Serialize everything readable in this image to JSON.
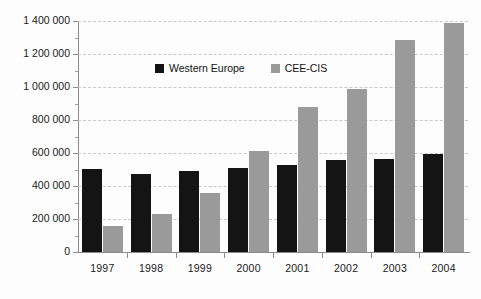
{
  "chart_data": {
    "type": "bar",
    "title": "",
    "subtitle": "",
    "xlabel": "",
    "ylabel": "",
    "categories": [
      "1997",
      "1998",
      "1999",
      "2000",
      "2001",
      "2002",
      "2003",
      "2004"
    ],
    "series": [
      {
        "name": "Western Europe",
        "color": "#141414",
        "values": [
          505000,
          470000,
          490000,
          510000,
          530000,
          560000,
          565000,
          595000
        ]
      },
      {
        "name": "CEE-CIS",
        "color": "#9a9a9a",
        "values": [
          160000,
          230000,
          360000,
          615000,
          880000,
          985000,
          1285000,
          1385000
        ]
      }
    ],
    "ylim": [
      0,
      1400000
    ],
    "y_tick_values": [
      0,
      200000,
      400000,
      600000,
      800000,
      1000000,
      1200000,
      1400000
    ],
    "y_tick_labels": [
      "0",
      "200 000",
      "400 000",
      "600 000",
      "800 000",
      "1 000 000",
      "1 200 000",
      "1 400 000"
    ],
    "y_minor_tick_interval": 100000,
    "grid": "horizontal-dashed",
    "legend_position": "inside-upper-left",
    "background_color": "#fdfdfd",
    "axis_color": "#8a8a8a",
    "gridline_color": "#c9c9c9"
  }
}
